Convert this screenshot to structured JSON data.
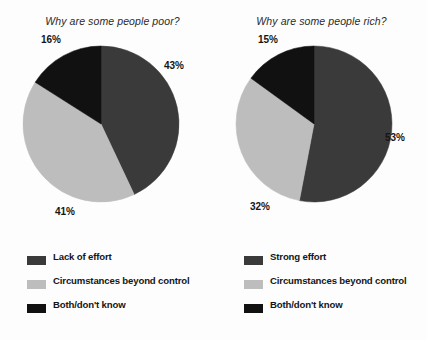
{
  "chart_data": [
    {
      "type": "pie",
      "id": "poor",
      "title": "Why are some people poor?",
      "categories": [
        "Lack of effort",
        "Circumstances beyond control",
        "Both/don't know"
      ],
      "values": [
        43,
        41,
        16
      ],
      "value_labels": [
        "43%",
        "41%",
        "16%"
      ],
      "colors": [
        "#3a3a3a",
        "#bdbdbd",
        "#111111"
      ],
      "start_angle": 0,
      "legend": {
        "position": "bottom-left",
        "entries": [
          {
            "label": "Lack of effort",
            "color": "#3a3a3a"
          },
          {
            "label": "Circumstances beyond control",
            "color": "#bdbdbd"
          },
          {
            "label": "Both/don't know",
            "color": "#111111"
          }
        ]
      },
      "label_positions": [
        {
          "text": "43%",
          "x": 164,
          "y": 20
        },
        {
          "text": "41%",
          "x": 55,
          "y": 166
        },
        {
          "text": "16%",
          "x": 41,
          "y": -6
        }
      ]
    },
    {
      "type": "pie",
      "id": "rich",
      "title": "Why are some people rich?",
      "categories": [
        "Strong effort",
        "Circumstances beyond control",
        "Both/don't know"
      ],
      "values": [
        53,
        32,
        15
      ],
      "value_labels": [
        "53%",
        "32%",
        "15%"
      ],
      "colors": [
        "#3a3a3a",
        "#bdbdbd",
        "#111111"
      ],
      "start_angle": 0,
      "legend": {
        "position": "bottom-left",
        "entries": [
          {
            "label": "Strong effort",
            "color": "#3a3a3a"
          },
          {
            "label": "Circumstances beyond control",
            "color": "#bdbdbd"
          },
          {
            "label": "Both/don't know",
            "color": "#111111"
          }
        ]
      },
      "label_positions": [
        {
          "text": "53%",
          "x": 172,
          "y": 92
        },
        {
          "text": "32%",
          "x": 37,
          "y": 161
        },
        {
          "text": "15%",
          "x": 45,
          "y": -6
        }
      ]
    }
  ],
  "geometry": {
    "pie_center_x": 101,
    "pie_center_y": 84,
    "pie_radius": 78
  }
}
